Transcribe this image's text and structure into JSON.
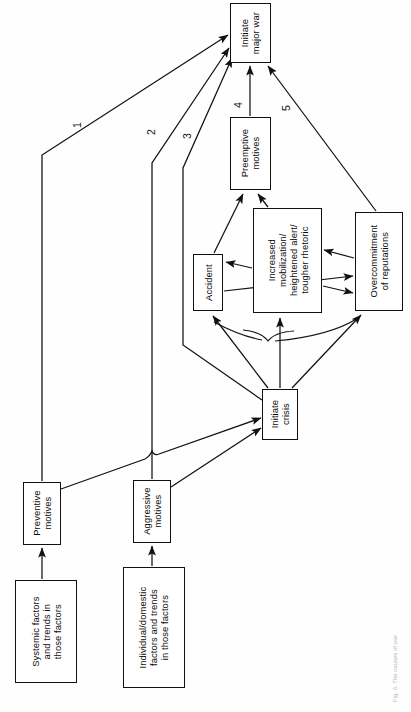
{
  "figure": {
    "orientation": "rotated-90-ccw",
    "caption": "Fig. 6. The causes of war",
    "ink_color": "#111111",
    "paper_color": "#fefefe"
  },
  "nodes": [
    {
      "id": "initiate-major-war",
      "label": "Initiate\nmajor war",
      "x": 230,
      "y": 3,
      "w": 41,
      "h": 60
    },
    {
      "id": "preemptive-motives",
      "label": "Preemptive\nmotives",
      "x": 230,
      "y": 117,
      "w": 41,
      "h": 73
    },
    {
      "id": "accident",
      "label": "Accident",
      "x": 193,
      "y": 254,
      "w": 30,
      "h": 57
    },
    {
      "id": "increased-mobilization",
      "label": "Increased\nmobilization/\nheightened alert/\ntougher rhetoric",
      "x": 253,
      "y": 208,
      "w": 69,
      "h": 105
    },
    {
      "id": "overcommitment-of-reputations",
      "label": "Overcommitment\nof reputations",
      "x": 355,
      "y": 212,
      "w": 48,
      "h": 99
    },
    {
      "id": "initiate-crisis",
      "label": "Initiate\ncrisis",
      "x": 262,
      "y": 389,
      "w": 36,
      "h": 51
    },
    {
      "id": "preventive-motives",
      "label": "Preventive\nmotives",
      "x": 23,
      "y": 482,
      "w": 38,
      "h": 63
    },
    {
      "id": "aggressive-motives",
      "label": "Aggressive\nmotives",
      "x": 133,
      "y": 480,
      "w": 38,
      "h": 63
    },
    {
      "id": "systemic-factors",
      "label": "Systemic factors\nand trends in\nthose factors",
      "x": 15,
      "y": 580,
      "w": 62,
      "h": 103
    },
    {
      "id": "individual-domestic-factors",
      "label": "Individual/domestic\nfactors and trends\nin those factors",
      "x": 123,
      "y": 567,
      "w": 62,
      "h": 121
    }
  ],
  "edge_labels": [
    {
      "id": "edge-label-1",
      "text": "1",
      "x": 77,
      "y": 126
    },
    {
      "id": "edge-label-2",
      "text": "2",
      "x": 151,
      "y": 133
    },
    {
      "id": "edge-label-3",
      "text": "3",
      "x": 187,
      "y": 137
    },
    {
      "id": "edge-label-4",
      "text": "4",
      "x": 238,
      "y": 106
    },
    {
      "id": "edge-label-5",
      "text": "5",
      "x": 286,
      "y": 109
    }
  ],
  "edges": [
    {
      "id": "edge-systemic-to-preventive",
      "from": "systemic-factors",
      "to": "preventive-motives"
    },
    {
      "id": "edge-individual-to-aggressive",
      "from": "individual-domestic-factors",
      "to": "aggressive-motives"
    },
    {
      "id": "edge-preventive-to-crisis",
      "from": "preventive-motives",
      "to": "initiate-crisis"
    },
    {
      "id": "edge-aggressive-to-crisis",
      "from": "aggressive-motives",
      "to": "initiate-crisis"
    },
    {
      "id": "edge-preventive-to-war",
      "from": "preventive-motives",
      "to": "initiate-major-war",
      "label": "1"
    },
    {
      "id": "edge-aggressive-to-war",
      "from": "aggressive-motives",
      "to": "initiate-major-war",
      "label": "2"
    },
    {
      "id": "edge-crisis-to-war",
      "from": "initiate-crisis",
      "to": "initiate-major-war",
      "label": "3"
    },
    {
      "id": "edge-preemptive-to-war",
      "from": "preemptive-motives",
      "to": "initiate-major-war",
      "label": "4"
    },
    {
      "id": "edge-overcommitment-to-war",
      "from": "overcommitment-of-reputations",
      "to": "initiate-major-war",
      "label": "5"
    },
    {
      "id": "edge-crisis-to-accident",
      "from": "initiate-crisis",
      "to": "accident"
    },
    {
      "id": "edge-crisis-to-mobilization",
      "from": "initiate-crisis",
      "to": "increased-mobilization"
    },
    {
      "id": "edge-crisis-to-overcommitment",
      "from": "initiate-crisis",
      "to": "overcommitment-of-reputations"
    },
    {
      "id": "edge-accident-to-preemptive",
      "from": "accident",
      "to": "preemptive-motives"
    },
    {
      "id": "edge-mobilization-to-preemptive",
      "from": "increased-mobilization",
      "to": "preemptive-motives"
    },
    {
      "id": "edge-mobilization-to-accident",
      "from": "increased-mobilization",
      "to": "accident"
    },
    {
      "id": "edge-accident-to-overcommitment",
      "from": "accident",
      "to": "overcommitment-of-reputations"
    },
    {
      "id": "edge-mobilization-to-overcommitment",
      "from": "increased-mobilization",
      "to": "overcommitment-of-reputations"
    },
    {
      "id": "edge-overcommitment-to-mobilization",
      "from": "overcommitment-of-reputations",
      "to": "increased-mobilization"
    }
  ]
}
